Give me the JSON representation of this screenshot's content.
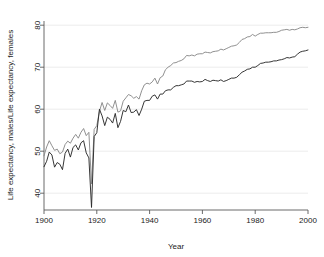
{
  "chart_data": {
    "type": "line",
    "title": "",
    "subtitle": "",
    "xlabel": "Year",
    "ylabel": "Life expectancy, males/Life expectancy, females",
    "xlim": [
      1900,
      2000
    ],
    "ylim": [
      36,
      81
    ],
    "xticks": [
      1900,
      1920,
      1940,
      1960,
      1980,
      2000
    ],
    "yticks": [
      40,
      50,
      60,
      70,
      80
    ],
    "xtick_labels": [
      "1900",
      "1920",
      "1940",
      "1960",
      "1980",
      "2000"
    ],
    "ytick_labels": [
      "40",
      "50",
      "60",
      "70",
      "80"
    ],
    "grid": true,
    "grid_axis": "y",
    "legend": false,
    "legend_position": "none",
    "x": [
      1900,
      1901,
      1902,
      1903,
      1904,
      1905,
      1906,
      1907,
      1908,
      1909,
      1910,
      1911,
      1912,
      1913,
      1914,
      1915,
      1916,
      1917,
      1918,
      1919,
      1920,
      1921,
      1922,
      1923,
      1924,
      1925,
      1926,
      1927,
      1928,
      1929,
      1930,
      1931,
      1932,
      1933,
      1934,
      1935,
      1936,
      1937,
      1938,
      1939,
      1940,
      1941,
      1942,
      1943,
      1944,
      1945,
      1946,
      1947,
      1948,
      1949,
      1950,
      1951,
      1952,
      1953,
      1954,
      1955,
      1956,
      1957,
      1958,
      1959,
      1960,
      1961,
      1962,
      1963,
      1964,
      1965,
      1966,
      1967,
      1968,
      1969,
      1970,
      1971,
      1972,
      1973,
      1974,
      1975,
      1976,
      1977,
      1978,
      1979,
      1980,
      1981,
      1982,
      1983,
      1984,
      1985,
      1986,
      1987,
      1988,
      1989,
      1990,
      1991,
      1992,
      1993,
      1994,
      1995,
      1996,
      1997,
      1998,
      1999,
      2000
    ],
    "series": [
      {
        "name": "Life expectancy, females",
        "color": "#8a8a8a",
        "values": [
          48.9,
          51.0,
          52.5,
          51.3,
          50.2,
          50.5,
          49.4,
          49.8,
          51.6,
          52.4,
          51.9,
          53.1,
          54.0,
          53.1,
          54.5,
          55.4,
          53.7,
          54.5,
          42.2,
          55.2,
          56.1,
          59.5,
          61.6,
          59.7,
          61.5,
          60.9,
          60.2,
          62.1,
          59.3,
          59.6,
          61.9,
          62.7,
          63.5,
          63.2,
          62.6,
          63.0,
          62.4,
          64.4,
          65.8,
          66.2,
          66.0,
          66.5,
          67.4,
          66.0,
          67.5,
          67.9,
          69.4,
          70.0,
          70.4,
          71.0,
          71.1,
          71.4,
          71.6,
          72.0,
          72.8,
          72.7,
          72.9,
          72.7,
          73.1,
          73.2,
          73.2,
          73.6,
          73.5,
          73.4,
          73.7,
          73.8,
          73.9,
          74.3,
          74.1,
          74.4,
          74.7,
          75.0,
          75.1,
          75.3,
          75.9,
          76.6,
          76.8,
          77.2,
          77.3,
          77.8,
          77.4,
          77.8,
          78.1,
          78.1,
          78.2,
          78.2,
          78.2,
          78.3,
          78.3,
          78.5,
          78.8,
          78.9,
          79.0,
          78.8,
          79.0,
          78.9,
          79.1,
          79.4,
          79.5,
          79.4,
          79.5
        ]
      },
      {
        "name": "Life expectancy, males",
        "color": "#2b2b2b",
        "values": [
          46.3,
          47.6,
          49.8,
          49.1,
          46.2,
          47.3,
          46.9,
          45.6,
          49.5,
          50.5,
          48.6,
          50.9,
          51.5,
          50.3,
          52.0,
          52.5,
          49.6,
          48.4,
          36.6,
          53.5,
          54.4,
          60.0,
          58.4,
          56.1,
          58.1,
          57.6,
          56.7,
          59.0,
          55.6,
          57.1,
          59.7,
          59.4,
          61.0,
          59.2,
          59.3,
          59.9,
          58.5,
          60.0,
          61.9,
          62.1,
          62.1,
          63.1,
          63.4,
          62.4,
          63.6,
          63.6,
          64.4,
          64.6,
          64.6,
          65.2,
          65.6,
          65.6,
          65.8,
          66.0,
          66.7,
          66.7,
          66.7,
          66.4,
          66.6,
          66.5,
          66.6,
          67.1,
          66.8,
          66.6,
          66.9,
          66.8,
          66.7,
          67.0,
          66.6,
          66.8,
          67.1,
          67.4,
          67.4,
          67.6,
          68.2,
          68.8,
          69.1,
          69.5,
          69.6,
          70.0,
          70.0,
          70.4,
          70.9,
          71.0,
          71.2,
          71.2,
          71.3,
          71.5,
          71.5,
          71.7,
          71.8,
          72.0,
          72.3,
          72.2,
          72.4,
          72.5,
          73.1,
          73.6,
          73.8,
          73.9,
          74.1
        ]
      }
    ]
  },
  "colors": {
    "female_line": "#8a8a8a",
    "male_line": "#2b2b2b",
    "axis": "#5a5a5a",
    "grid": "#e8e8e8",
    "text": "#222222",
    "background": "#ffffff"
  }
}
